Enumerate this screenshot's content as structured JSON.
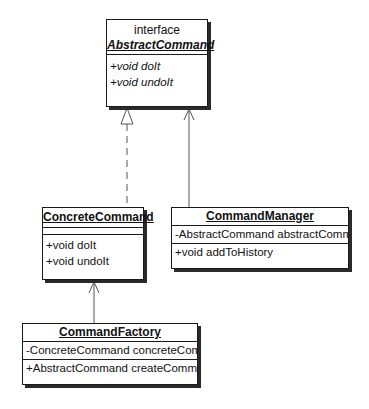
{
  "diagram": {
    "type": "uml-class-diagram",
    "classes": [
      {
        "id": "abstract-command",
        "stereotype": "interface",
        "name": "AbstractCommand",
        "abstract": true,
        "attributes": [],
        "operations": [
          "+void doIt",
          "+void undoIt"
        ]
      },
      {
        "id": "concrete-command",
        "name": "ConcreteCommand",
        "abstract": false,
        "attributes": [],
        "operations": [
          "+void doIt",
          "+void undoIt"
        ]
      },
      {
        "id": "command-manager",
        "name": "CommandManager",
        "abstract": false,
        "attributes": [
          "-AbstractCommand abstractComm"
        ],
        "operations": [
          "+void addToHistory"
        ]
      },
      {
        "id": "command-factory",
        "name": "CommandFactory",
        "abstract": false,
        "attributes": [
          "-ConcreteCommand concreteCom"
        ],
        "operations": [
          "+AbstractCommand createComma"
        ]
      }
    ],
    "relationships": [
      {
        "from": "ConcreteCommand",
        "to": "AbstractCommand",
        "type": "realization",
        "style": "dashed line, hollow triangle"
      },
      {
        "from": "CommandManager",
        "to": "AbstractCommand",
        "type": "association",
        "style": "solid line, open arrow"
      },
      {
        "from": "CommandFactory",
        "to": "ConcreteCommand",
        "type": "association",
        "style": "solid line, open arrow"
      }
    ],
    "colors": {
      "background": "#ffffff",
      "line": "#1a1a1a",
      "connector": "#555555"
    }
  }
}
